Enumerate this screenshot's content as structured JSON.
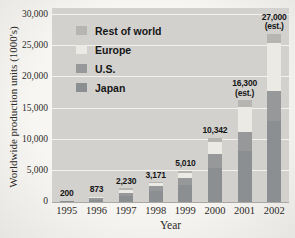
{
  "chart_data": {
    "type": "bar",
    "stacked": true,
    "xlabel": "Year",
    "ylabel": "Worldwide production units (1000's)",
    "categories": [
      "1995",
      "1996",
      "1997",
      "1998",
      "1999",
      "2000",
      "2001",
      "2002"
    ],
    "totals": [
      200,
      873,
      2230,
      3171,
      5010,
      10342,
      16300,
      27000
    ],
    "total_labels": [
      "200",
      "873",
      "2,230",
      "3,171",
      "5,010",
      "10,342",
      "16,300",
      "27,000"
    ],
    "estimated": [
      false,
      false,
      false,
      false,
      false,
      false,
      true,
      true
    ],
    "est_suffix": "(est.)",
    "series": [
      {
        "name": "Rest of world",
        "color": "#b7b5b1",
        "values": [
          20,
          123,
          280,
          121,
          360,
          742,
          1000,
          1500
        ]
      },
      {
        "name": "Europe",
        "color": "#eceae5",
        "values": [
          20,
          150,
          550,
          550,
          750,
          1900,
          4000,
          7700
        ]
      },
      {
        "name": "U.S.",
        "color": "#96989a",
        "values": [
          40,
          200,
          500,
          800,
          1100,
          2200,
          3100,
          4800
        ]
      },
      {
        "name": "Japan",
        "color": "#8c8f92",
        "values": [
          120,
          400,
          900,
          1700,
          2800,
          5500,
          8200,
          13000
        ]
      }
    ],
    "ylim": [
      0,
      30000
    ],
    "ytick_step": 5000,
    "ytick_labels": [
      "0",
      "5,000",
      "10,000",
      "15,000",
      "20,000",
      "25,000",
      "30,000"
    ],
    "grid": true,
    "grid_color": "#f3f2ef",
    "plot_bg": "#d2d1ce",
    "legend_position": "upper-left"
  }
}
